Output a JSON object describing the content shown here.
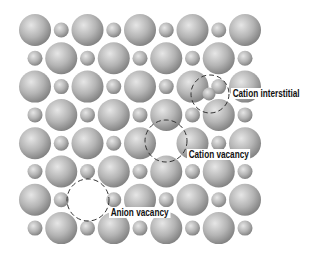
{
  "figure": {
    "type": "crystal-defects-diagram",
    "lattice": {
      "rows": 8,
      "cols": 9,
      "origin_x": 35,
      "origin_y": 30,
      "dx": 26.25,
      "dy": 28.3,
      "anion_radius": 16,
      "cation_radius": 7.5,
      "pattern": "alternating anion (large) / cation (small) checkerboard"
    },
    "defects": [
      {
        "kind": "cation-interstitial",
        "label": "Cation interstitial",
        "marker_cx": 210,
        "marker_cy": 94,
        "marker_r": 19,
        "extra_cation": {
          "cx": 209,
          "cy": 94,
          "r": 6.5
        },
        "label_x": 231,
        "label_y": 88
      },
      {
        "kind": "cation-vacancy",
        "label": "Cation vacancy",
        "marker_cx": 166,
        "marker_cy": 141,
        "marker_r": 21,
        "missing": {
          "row": 4,
          "col": 5
        },
        "label_x": 187,
        "label_y": 149
      },
      {
        "kind": "anion-vacancy",
        "label": "Anion vacancy",
        "marker_cx": 88,
        "marker_cy": 200,
        "marker_r": 21,
        "missing": {
          "row": 6,
          "col": 2
        },
        "label_x": 109,
        "label_y": 207
      }
    ],
    "colors": {
      "sphere_highlight": "#e6e6e6",
      "sphere_mid": "#b4b4b4",
      "sphere_shadow": "#7e7e7e",
      "dash": "#333333",
      "background": "#ffffff"
    }
  },
  "labels": {
    "cation_interstitial": "Cation interstitial",
    "cation_vacancy": "Cation vacancy",
    "anion_vacancy": "Anion vacancy"
  }
}
